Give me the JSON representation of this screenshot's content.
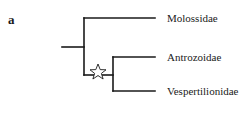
{
  "figure": {
    "panel_label": "a",
    "line_color": "#1a1a1a",
    "taxa": [
      {
        "name": "Molossidae"
      },
      {
        "name": "Antrozoidae"
      },
      {
        "name": "Vespertilionidae"
      }
    ],
    "node_marker": {
      "icon": "star-outline-icon",
      "node": "Antrozoidae+Vespertilionidae"
    }
  }
}
